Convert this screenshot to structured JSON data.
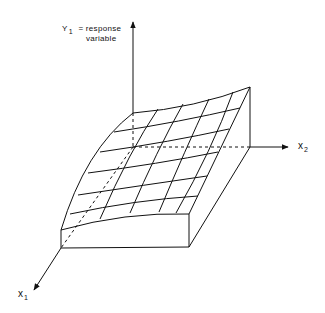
{
  "diagram": {
    "type": "response-surface-3d",
    "axes": {
      "y": {
        "symbol": "Y",
        "subscript": "1",
        "description_line1": "= response",
        "description_line2": "variable"
      },
      "x1": {
        "symbol": "x",
        "subscript": "1"
      },
      "x2": {
        "symbol": "x",
        "subscript": "2"
      }
    },
    "grid": {
      "rows": 6,
      "cols": 4
    },
    "colors": {
      "stroke": "#111111",
      "background": "#ffffff"
    }
  }
}
